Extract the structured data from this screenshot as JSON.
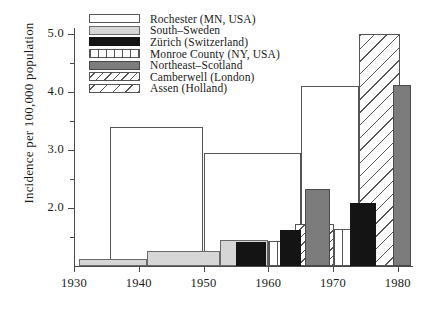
{
  "chart_data": {
    "type": "bar",
    "title": "",
    "xlabel": "",
    "ylabel": "Incidence per 100,000 population",
    "xlim": [
      1930,
      1982
    ],
    "ylim": [
      1.0,
      5.1
    ],
    "xticks": [
      "1930",
      "1940",
      "1950",
      "1960",
      "1970",
      "1980"
    ],
    "yticks": [
      "2.0",
      "3.0",
      "4.0",
      "5.0"
    ],
    "grid": false,
    "legend_position": "top-left",
    "legend": [
      {
        "label": "Rochester (MN, USA)",
        "pattern": "outline-white"
      },
      {
        "label": "South–Sweden",
        "pattern": "light-gray"
      },
      {
        "label": "Zürich (Switzerland)",
        "pattern": "solid-black"
      },
      {
        "label": "Monroe County (NY, USA)",
        "pattern": "vertical-stripes"
      },
      {
        "label": "Northeast–Scotland",
        "pattern": "dark-gray"
      },
      {
        "label": "Camberwell (London)",
        "pattern": "dense-diagonal-hatch"
      },
      {
        "label": "Assen (Holland)",
        "pattern": "sparse-diagonal-hatch"
      }
    ],
    "series": [
      {
        "name": "Rochester (MN, USA)",
        "pattern": "outline-white",
        "bars": [
          {
            "x_start": 1935.5,
            "x_end": 1950.0,
            "value": 3.4
          },
          {
            "x_start": 1950.0,
            "x_end": 1965.0,
            "value": 2.95
          },
          {
            "x_start": 1965.0,
            "x_end": 1974.0,
            "value": 4.1
          }
        ]
      },
      {
        "name": "South–Sweden",
        "pattern": "light-gray",
        "bars": [
          {
            "x_start": 1930.8,
            "x_end": 1941.3,
            "value": 1.12
          },
          {
            "x_start": 1941.3,
            "x_end": 1952.5,
            "value": 1.26
          },
          {
            "x_start": 1952.5,
            "x_end": 1960.0,
            "value": 1.44
          }
        ]
      },
      {
        "name": "Zürich (Switzerland)",
        "pattern": "solid-black",
        "bars": [
          {
            "x_start": 1955.0,
            "x_end": 1959.7,
            "value": 1.42
          },
          {
            "x_start": 1961.8,
            "x_end": 1965.0,
            "value": 1.62
          },
          {
            "x_start": 1972.6,
            "x_end": 1976.6,
            "value": 2.08
          }
        ]
      },
      {
        "name": "Monroe County (NY, USA)",
        "pattern": "vertical-stripes",
        "bars": [
          {
            "x_start": 1960.0,
            "x_end": 1965.0,
            "value": 1.43
          },
          {
            "x_start": 1965.0,
            "x_end": 1977.0,
            "value": 1.64
          }
        ]
      },
      {
        "name": "Northeast–Scotland",
        "pattern": "dark-gray",
        "bars": [
          {
            "x_start": 1965.7,
            "x_end": 1969.6,
            "value": 2.33
          },
          {
            "x_start": 1979.3,
            "x_end": 1982.0,
            "value": 4.12
          }
        ]
      },
      {
        "name": "Camberwell (London)",
        "pattern": "dense-diagonal-hatch",
        "bars": [
          {
            "x_start": 1964.2,
            "x_end": 1970.1,
            "value": 1.72
          }
        ]
      },
      {
        "name": "Assen (Holland)",
        "pattern": "sparse-diagonal-hatch",
        "bars": [
          {
            "x_start": 1974.0,
            "x_end": 1980.4,
            "value": 5.0
          }
        ]
      }
    ]
  },
  "axis": {
    "y_title": "Incidence per 100,000 population",
    "y_ticks": [
      {
        "label": "5.0",
        "value": 5.0
      },
      {
        "label": "4.0",
        "value": 4.0
      },
      {
        "label": "3.0",
        "value": 3.0
      },
      {
        "label": "2.0",
        "value": 2.0
      }
    ],
    "x_ticks": [
      {
        "label": "1930",
        "value": 1930
      },
      {
        "label": "1940",
        "value": 1940
      },
      {
        "label": "1950",
        "value": 1950
      },
      {
        "label": "1960",
        "value": 1960
      },
      {
        "label": "1970",
        "value": 1970
      },
      {
        "label": "1980",
        "value": 1980
      }
    ]
  },
  "colors": {
    "axis": "#4a4a4a",
    "light_gray_fill": "#d6d6d6",
    "dark_gray_fill": "#7c7c7c",
    "black_fill": "#141414",
    "background": "#ffffff"
  }
}
